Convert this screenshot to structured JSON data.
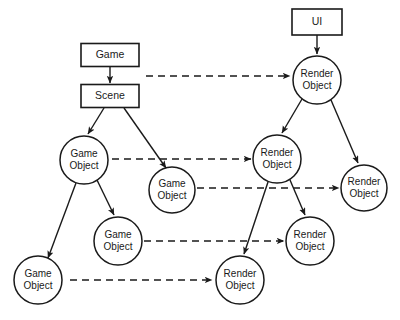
{
  "diagram": {
    "background_color": "#ffffff",
    "stroke_color": "#1a1a1a",
    "nodes": [
      {
        "id": "game",
        "shape": "rect",
        "label_line1": "Game",
        "label_line2": "",
        "x": 110,
        "y": 55,
        "w": 58,
        "h": 23
      },
      {
        "id": "scene",
        "shape": "rect",
        "label_line1": "Scene",
        "label_line2": "",
        "x": 110,
        "y": 96,
        "w": 58,
        "h": 23
      },
      {
        "id": "ui",
        "shape": "rect",
        "label_line1": "UI",
        "label_line2": "",
        "x": 317,
        "y": 22,
        "w": 50,
        "h": 26
      },
      {
        "id": "ro_top",
        "shape": "circle",
        "label_line1": "Render",
        "label_line2": "Object",
        "x": 317,
        "y": 80,
        "r": 24
      },
      {
        "id": "go_1",
        "shape": "circle",
        "label_line1": "Game",
        "label_line2": "Object",
        "x": 84,
        "y": 160,
        "r": 24
      },
      {
        "id": "go_2",
        "shape": "circle",
        "label_line1": "Game",
        "label_line2": "Object",
        "x": 172,
        "y": 190,
        "r": 23
      },
      {
        "id": "ro_mid",
        "shape": "circle",
        "label_line1": "Render",
        "label_line2": "Object",
        "x": 277,
        "y": 159,
        "r": 24
      },
      {
        "id": "ro_rgt",
        "shape": "circle",
        "label_line1": "Render",
        "label_line2": "Object",
        "x": 364,
        "y": 188,
        "r": 23
      },
      {
        "id": "go_3",
        "shape": "circle",
        "label_line1": "Game",
        "label_line2": "Object",
        "x": 118,
        "y": 241,
        "r": 24
      },
      {
        "id": "ro_3",
        "shape": "circle",
        "label_line1": "Render",
        "label_line2": "Object",
        "x": 310,
        "y": 241,
        "r": 24
      },
      {
        "id": "go_4",
        "shape": "circle",
        "label_line1": "Game",
        "label_line2": "Object",
        "x": 38,
        "y": 280,
        "r": 24
      },
      {
        "id": "ro_4",
        "shape": "circle",
        "label_line1": "Render",
        "label_line2": "Object",
        "x": 240,
        "y": 280,
        "r": 24
      }
    ],
    "solid_edges": [
      {
        "id": "game-to-scene",
        "from": "game",
        "to": "scene",
        "x1": 110,
        "y1": 67,
        "x2": 110,
        "y2": 83
      },
      {
        "id": "ui-to-ro-top",
        "from": "ui",
        "to": "ro_top",
        "x1": 317,
        "y1": 35,
        "x2": 317,
        "y2": 54
      },
      {
        "id": "scene-to-go1",
        "from": "scene",
        "to": "go_1",
        "x1": 104,
        "y1": 108,
        "x2": 88,
        "y2": 134
      },
      {
        "id": "scene-to-go2",
        "from": "scene",
        "to": "go_2",
        "x1": 124,
        "y1": 108,
        "x2": 166,
        "y2": 168
      },
      {
        "id": "ro-top-to-ro-mid",
        "from": "ro_top",
        "to": "ro_mid",
        "x1": 302,
        "y1": 99,
        "x2": 282,
        "y2": 133
      },
      {
        "id": "ro-top-to-ro-rgt",
        "from": "ro_top",
        "to": "ro_rgt",
        "x1": 331,
        "y1": 100,
        "x2": 358,
        "y2": 163
      },
      {
        "id": "go1-to-go4",
        "from": "go_1",
        "to": "go_4",
        "x1": 76,
        "y1": 183,
        "x2": 48,
        "y2": 258
      },
      {
        "id": "go1-to-go3",
        "from": "go_1",
        "to": "go_3",
        "x1": 97,
        "y1": 180,
        "x2": 114,
        "y2": 215
      },
      {
        "id": "ro-mid-to-ro4",
        "from": "ro_mid",
        "to": "ro_4",
        "x1": 268,
        "y1": 182,
        "x2": 244,
        "y2": 254
      },
      {
        "id": "ro-mid-to-ro3",
        "from": "ro_mid",
        "to": "ro_3",
        "x1": 290,
        "y1": 180,
        "x2": 305,
        "y2": 215
      }
    ],
    "dashed_edges": [
      {
        "id": "scene-to-ro-top",
        "from": "scene",
        "to": "ro_top",
        "x1": 146,
        "y1": 76,
        "x2": 290,
        "y2": 76
      },
      {
        "id": "go1-to-ro-mid",
        "from": "go_1",
        "to": "ro_mid",
        "x1": 112,
        "y1": 159,
        "x2": 251,
        "y2": 159
      },
      {
        "id": "go2-to-ro-rgt",
        "from": "go_2",
        "to": "ro_rgt",
        "x1": 197,
        "y1": 188,
        "x2": 339,
        "y2": 188
      },
      {
        "id": "go3-to-ro3",
        "from": "go_3",
        "to": "ro_3",
        "x1": 144,
        "y1": 241,
        "x2": 284,
        "y2": 241
      },
      {
        "id": "go4-to-ro4",
        "from": "go_4",
        "to": "ro_4",
        "x1": 70,
        "y1": 280,
        "x2": 212,
        "y2": 280
      }
    ]
  }
}
